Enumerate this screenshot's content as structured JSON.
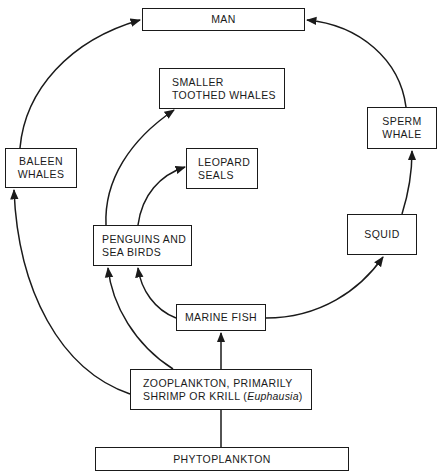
{
  "diagram": {
    "type": "food-web",
    "nodes": {
      "man": {
        "lines": [
          "MAN"
        ]
      },
      "smaller_toothed_whales": {
        "lines": [
          "SMALLER",
          "TOOTHED WHALES"
        ]
      },
      "baleen_whales": {
        "lines": [
          "BALEEN",
          "WHALES"
        ]
      },
      "leopard_seals": {
        "lines": [
          "LEOPARD",
          "SEALS"
        ]
      },
      "sperm_whale": {
        "lines": [
          "SPERM",
          "WHALE"
        ]
      },
      "penguins": {
        "lines": [
          "PENGUINS AND",
          "SEA BIRDS"
        ]
      },
      "squid": {
        "lines": [
          "SQUID"
        ]
      },
      "marine_fish": {
        "lines": [
          "MARINE FISH"
        ]
      },
      "zooplankton": {
        "lines": [
          "ZOOPLANKTON, PRIMARILY",
          "SHRIMP OR KRILL ("
        ],
        "italic": "Euphausia",
        "suffix": ")"
      },
      "phytoplankton": {
        "lines": [
          "PHYTOPLANKTON"
        ]
      }
    },
    "edges": [
      {
        "from": "PHYTOPLANKTON",
        "to": "ZOOPLANKTON"
      },
      {
        "from": "ZOOPLANKTON",
        "to": "MARINE FISH"
      },
      {
        "from": "ZOOPLANKTON",
        "to": "BALEEN WHALES"
      },
      {
        "from": "ZOOPLANKTON",
        "to": "PENGUINS AND SEA BIRDS"
      },
      {
        "from": "MARINE FISH",
        "to": "PENGUINS AND SEA BIRDS"
      },
      {
        "from": "MARINE FISH",
        "to": "SQUID"
      },
      {
        "from": "PENGUINS AND SEA BIRDS",
        "to": "SMALLER TOOTHED WHALES"
      },
      {
        "from": "PENGUINS AND SEA BIRDS",
        "to": "LEOPARD SEALS"
      },
      {
        "from": "SQUID",
        "to": "SPERM WHALE"
      },
      {
        "from": "BALEEN WHALES",
        "to": "MAN"
      },
      {
        "from": "SPERM WHALE",
        "to": "MAN"
      }
    ]
  }
}
